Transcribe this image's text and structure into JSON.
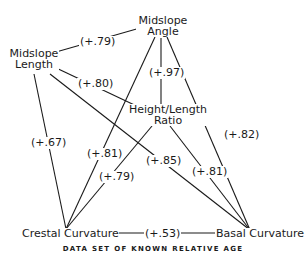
{
  "diagram": {
    "caption": "DATA SET OF KNOWN RELATIVE AGE",
    "nodes": {
      "midslope_angle": {
        "line1": "Midslope",
        "line2": "Angle"
      },
      "midslope_length": {
        "line1": "Midslope",
        "line2": "Length"
      },
      "height_length_ratio": {
        "line1": "Height/Length",
        "line2": "Ratio"
      },
      "crestal_curvature": {
        "label": "Crestal Curvature"
      },
      "basal_curvature": {
        "label": "Basal Curvature"
      }
    },
    "edges": [
      {
        "from": "Midslope Length",
        "to": "Midslope Angle",
        "label": "(+.79)"
      },
      {
        "from": "Midslope Angle",
        "to": "Height/Length Ratio",
        "label": "(+.97)"
      },
      {
        "from": "Midslope Length",
        "to": "Height/Length Ratio",
        "label": "(+.80)"
      },
      {
        "from": "Midslope Angle",
        "to": "Basal Curvature",
        "label": "(+.82)"
      },
      {
        "from": "Midslope Length",
        "to": "Crestal Curvature",
        "label": "(+.67)"
      },
      {
        "from": "Midslope Angle",
        "to": "Crestal Curvature",
        "label": "(+.81)"
      },
      {
        "from": "Midslope Length",
        "to": "Basal Curvature",
        "label": "(+.85)"
      },
      {
        "from": "Height/Length Ratio",
        "to": "Basal Curvature",
        "label": "(+.81)"
      },
      {
        "from": "Height/Length Ratio",
        "to": "Crestal Curvature",
        "label": "(+.79)"
      },
      {
        "from": "Crestal Curvature",
        "to": "Basal Curvature",
        "label": "(+.53)"
      }
    ]
  }
}
